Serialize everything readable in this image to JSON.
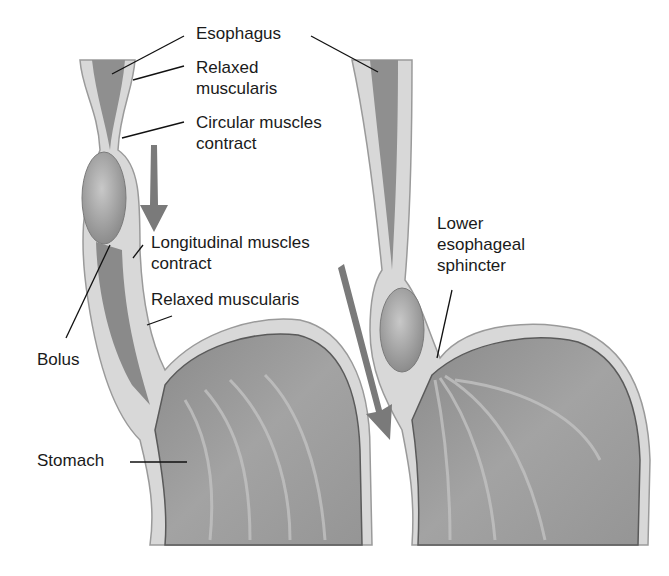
{
  "diagram": {
    "panels": [
      {
        "name": "left-panel",
        "description": "Bolus moving down the esophagus"
      },
      {
        "name": "right-panel",
        "description": "Bolus passing lower esophageal sphincter into stomach"
      }
    ],
    "labels": {
      "esophagus": "Esophagus",
      "relaxed_muscularis_top_1": "Relaxed",
      "relaxed_muscularis_top_2": "muscularis",
      "circular_1": "Circular muscles",
      "circular_2": "contract",
      "longitudinal_1": "Longitudinal muscles",
      "longitudinal_2": "contract",
      "relaxed_muscularis_bottom": "Relaxed muscularis",
      "bolus": "Bolus",
      "stomach": "Stomach",
      "les_1": "Lower",
      "les_2": "esophageal",
      "les_3": "sphincter"
    },
    "colors": {
      "wall_outer": "#c9c9c9",
      "wall_light": "#e6e6e6",
      "lumen": "#8f8f8f",
      "bolus": "#a9a9a9",
      "arrow": "#7a7a7a",
      "leader": "#111111"
    }
  }
}
